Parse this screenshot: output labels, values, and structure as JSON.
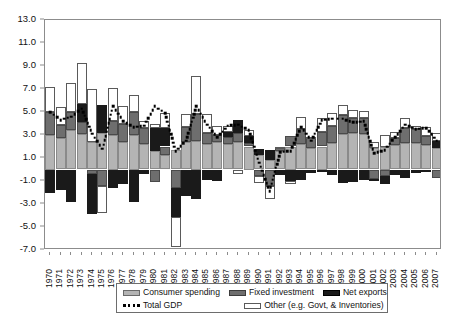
{
  "chart_data": {
    "type": "bar",
    "title": "",
    "subtitle": "",
    "xlabel": "",
    "ylabel": "",
    "stacked": true,
    "grid": false,
    "legend_position": "bottom",
    "ylim": [
      -7.0,
      13.0
    ],
    "yticks": [
      13.0,
      11.0,
      9.0,
      7.0,
      5.0,
      3.0,
      1.0,
      -1.0,
      -3.0,
      -5.0,
      -7.0
    ],
    "ytick_labels": [
      "13.0",
      "11.0",
      "9.0",
      "7.0",
      "5.0",
      "3.0",
      "1.0",
      "-1.0",
      "-3.0",
      "-5.0",
      "-7.0"
    ],
    "categories": [
      "1970",
      "1971",
      "1972",
      "1973",
      "1974",
      "1975",
      "1976",
      "1977",
      "1978",
      "1979",
      "1980",
      "1981",
      "1982",
      "1983",
      "1984",
      "1985",
      "1986",
      "1987",
      "1988",
      "1989",
      "1990",
      "1991",
      "1992",
      "1993",
      "1994",
      "1995",
      "1996",
      "1997",
      "1998",
      "1999",
      "2000",
      "2001",
      "2002",
      "2003",
      "2004",
      "2005",
      "2006",
      "2007"
    ],
    "series": [
      {
        "name": "Consumer spending",
        "color": "#b4b4b4",
        "values": [
          3.0,
          2.7,
          3.4,
          3.1,
          2.4,
          3.2,
          3.0,
          2.4,
          3.0,
          2.2,
          1.6,
          1.3,
          1.7,
          2.4,
          2.5,
          2.2,
          2.4,
          2.2,
          2.4,
          2.0,
          1.3,
          0.8,
          1.6,
          2.0,
          2.2,
          1.9,
          2.0,
          2.3,
          3.1,
          3.2,
          3.1,
          1.9,
          2.0,
          2.1,
          2.3,
          2.3,
          2.1,
          1.9
        ]
      },
      {
        "name": "Fixed investment",
        "color": "#6e6e6e",
        "values": [
          2.0,
          1.2,
          1.6,
          1.0,
          -0.4,
          -1.4,
          1.2,
          1.6,
          2.0,
          1.4,
          -1.1,
          0.7,
          -1.6,
          1.3,
          2.3,
          1.0,
          0.6,
          0.6,
          0.8,
          0.3,
          -0.6,
          -1.4,
          0.3,
          0.9,
          1.3,
          0.8,
          1.3,
          1.5,
          1.6,
          1.3,
          1.4,
          -0.8,
          -0.6,
          0.6,
          1.3,
          1.2,
          0.8,
          -0.7
        ]
      },
      {
        "name": "Net exports",
        "color": "#1a1a1a",
        "values": [
          -2.0,
          -1.8,
          -2.8,
          1.6,
          -3.5,
          2.4,
          -1.6,
          -1.3,
          -2.8,
          -0.4,
          2.0,
          1.6,
          -2.5,
          -2.3,
          -2.6,
          -0.9,
          -1.0,
          0.5,
          1.1,
          0.6,
          0.5,
          0.9,
          -0.5,
          -1.0,
          -0.9,
          -0.3,
          -0.2,
          -0.5,
          -1.2,
          -1.1,
          -0.9,
          -0.2,
          -0.7,
          -0.5,
          -0.7,
          -0.3,
          -0.1,
          0.6
        ]
      },
      {
        "name": "Other (e.g. Govt, & Inventories)",
        "color": "#ffffff",
        "values": [
          2.2,
          1.5,
          2.5,
          3.6,
          4.6,
          -2.4,
          2.9,
          1.5,
          1.5,
          0.6,
          0.4,
          1.3,
          -2.6,
          1.1,
          3.3,
          1.6,
          0.8,
          0.5,
          -0.4,
          0.5,
          -0.6,
          -1.2,
          0.1,
          -0.3,
          1.1,
          0.1,
          1.2,
          1.1,
          0.9,
          0.7,
          0.6,
          0.5,
          1.0,
          0.6,
          0.9,
          0.3,
          0.8,
          0.7
        ]
      }
    ],
    "overlay_line": {
      "name": "Total GDP",
      "style": "dotted",
      "color": "#000000",
      "values": [
        5.0,
        4.3,
        4.6,
        5.3,
        3.1,
        1.8,
        5.5,
        4.2,
        3.7,
        3.8,
        5.5,
        4.9,
        1.6,
        2.5,
        5.5,
        3.9,
        2.8,
        3.8,
        3.9,
        3.4,
        0.6,
        -1.9,
        1.5,
        1.6,
        3.7,
        2.5,
        4.3,
        4.4,
        4.4,
        4.1,
        4.2,
        1.4,
        1.7,
        2.8,
        3.9,
        3.5,
        3.6,
        2.5
      ]
    }
  },
  "legend": {
    "items": [
      {
        "label": "Consumer spending",
        "swatch": "consumer-swatch"
      },
      {
        "label": "Fixed investment",
        "swatch": "fixed-swatch"
      },
      {
        "label": "Net exports",
        "swatch": "net-swatch"
      },
      {
        "label": "Total GDP",
        "swatch": "gdp-dotted-swatch"
      },
      {
        "label": "Other (e.g. Govt,  & Inventories)",
        "swatch": "other-swatch"
      }
    ]
  }
}
